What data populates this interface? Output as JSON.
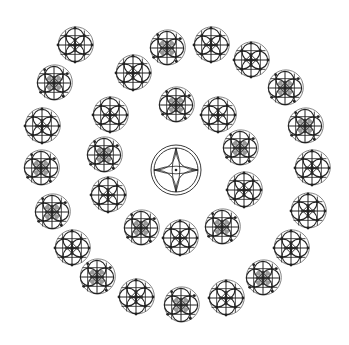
{
  "canvas": {
    "width": 349,
    "height": 345,
    "background": "#ffffff"
  },
  "colors": {
    "stroke": "#222222",
    "outer_ring": "#666666",
    "fill_dark": "#444444"
  },
  "center_motif": {
    "type": "quatrefoil-star",
    "cx": 176,
    "cy": 170,
    "r_outer": 25,
    "r_inner": 22
  },
  "motif_radius": 17,
  "inner_ring": [
    {
      "cx": 176,
      "cy": 105,
      "variant": "b"
    },
    {
      "cx": 218,
      "cy": 115,
      "variant": "a"
    },
    {
      "cx": 240,
      "cy": 148,
      "variant": "b"
    },
    {
      "cx": 244,
      "cy": 190,
      "variant": "a"
    },
    {
      "cx": 222,
      "cy": 227,
      "variant": "b"
    },
    {
      "cx": 180,
      "cy": 238,
      "variant": "a"
    },
    {
      "cx": 141,
      "cy": 228,
      "variant": "b"
    },
    {
      "cx": 108,
      "cy": 195,
      "variant": "a"
    },
    {
      "cx": 104,
      "cy": 155,
      "variant": "b"
    },
    {
      "cx": 110,
      "cy": 115,
      "variant": "a"
    },
    {
      "cx": 133,
      "cy": 73,
      "variant": "a"
    }
  ],
  "outer_ring": [
    {
      "cx": 167,
      "cy": 48,
      "variant": "b"
    },
    {
      "cx": 211,
      "cy": 45,
      "variant": "a"
    },
    {
      "cx": 251,
      "cy": 60,
      "variant": "a"
    },
    {
      "cx": 285,
      "cy": 88,
      "variant": "b"
    },
    {
      "cx": 305,
      "cy": 126,
      "variant": "b"
    },
    {
      "cx": 312,
      "cy": 168,
      "variant": "a"
    },
    {
      "cx": 308,
      "cy": 211,
      "variant": "a"
    },
    {
      "cx": 291,
      "cy": 248,
      "variant": "a"
    },
    {
      "cx": 263,
      "cy": 278,
      "variant": "b"
    },
    {
      "cx": 226,
      "cy": 298,
      "variant": "a"
    },
    {
      "cx": 181,
      "cy": 305,
      "variant": "b"
    },
    {
      "cx": 136,
      "cy": 297,
      "variant": "a"
    },
    {
      "cx": 97,
      "cy": 277,
      "variant": "b"
    },
    {
      "cx": 72,
      "cy": 248,
      "variant": "a"
    },
    {
      "cx": 52,
      "cy": 212,
      "variant": "b"
    },
    {
      "cx": 41,
      "cy": 168,
      "variant": "b"
    },
    {
      "cx": 42,
      "cy": 126,
      "variant": "a"
    },
    {
      "cx": 54,
      "cy": 83,
      "variant": "b"
    },
    {
      "cx": 75,
      "cy": 45,
      "variant": "a"
    }
  ]
}
